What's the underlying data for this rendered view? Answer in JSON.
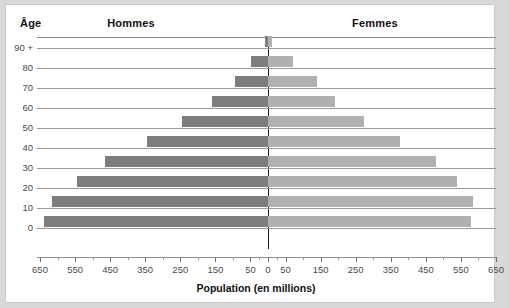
{
  "header": {
    "age_label": "Âge",
    "left_group": "Hommes",
    "right_group": "Femmes"
  },
  "axis": {
    "x_title": "Population (en millions)",
    "x_ticks": [
      650,
      550,
      450,
      350,
      250,
      150,
      50,
      0,
      50,
      150,
      250,
      350,
      450,
      550,
      650
    ],
    "y_ticks": [
      "90 +",
      "80",
      "70",
      "60",
      "50",
      "40",
      "30",
      "20",
      "10",
      "0"
    ]
  },
  "colors": {
    "male_bar": "#7d7d7d",
    "female_bar": "#b0b0b0",
    "axis_line": "#1a1a1a",
    "gridline": "#9a9a98",
    "background": "#ffffff",
    "page_background": "#d8d8d6"
  },
  "chart_data": {
    "type": "bar",
    "title": "",
    "subtitle": "",
    "xlabel": "Population (en millions)",
    "ylabel": "Âge",
    "xlim": [
      -700,
      700
    ],
    "xtick_values": [
      650,
      550,
      450,
      350,
      250,
      150,
      50,
      0,
      50,
      150,
      250,
      350,
      450,
      550,
      650
    ],
    "grid": true,
    "legend_position": "top",
    "orientation": "horizontal",
    "layout": "population-pyramid",
    "categories": [
      "90 +",
      "80",
      "70",
      "60",
      "50",
      "40",
      "30",
      "20",
      "10",
      "0"
    ],
    "series": [
      {
        "name": "Hommes",
        "color": "#7d7d7d",
        "unit": "millions",
        "values": [
          8,
          48,
          95,
          160,
          245,
          345,
          465,
          545,
          615,
          640
        ]
      },
      {
        "name": "Femmes",
        "color": "#b0b0b0",
        "unit": "millions",
        "values": [
          12,
          70,
          140,
          190,
          275,
          375,
          480,
          540,
          585,
          578
        ]
      }
    ]
  }
}
